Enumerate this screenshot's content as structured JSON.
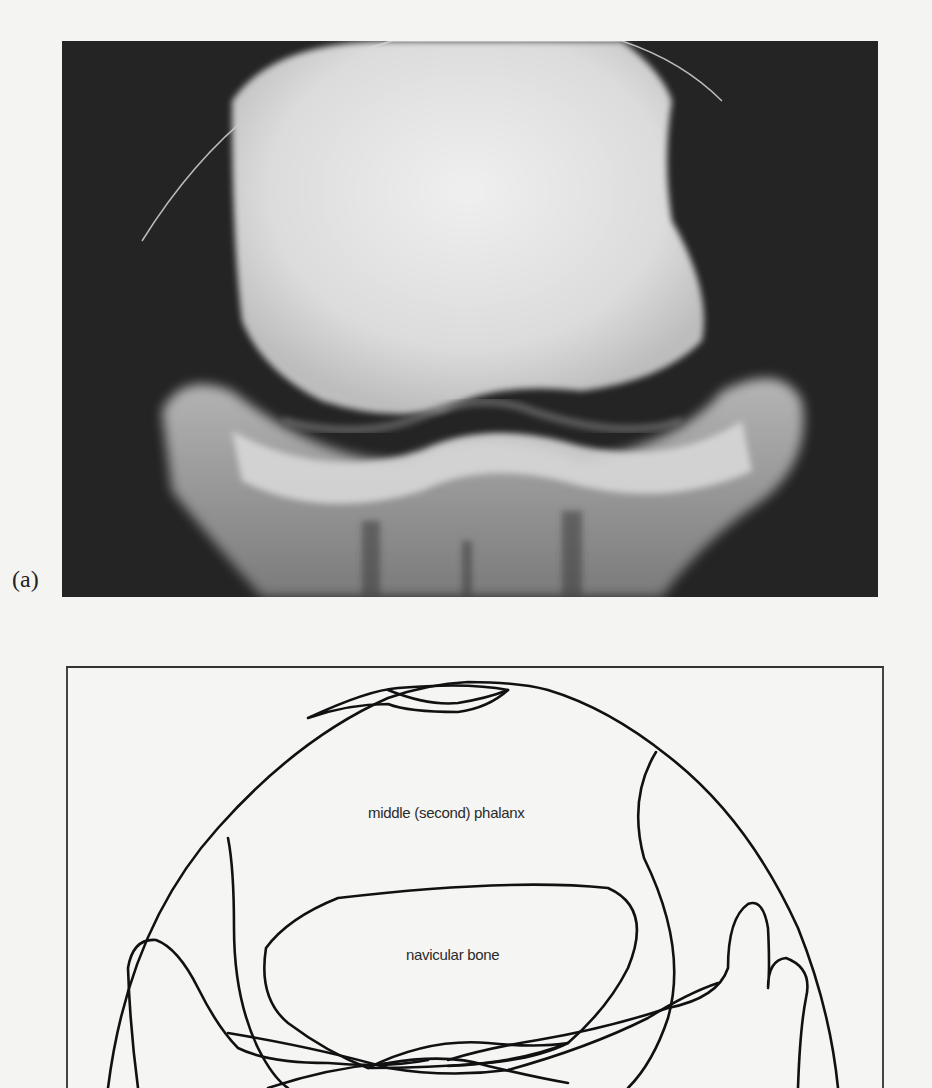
{
  "figure": {
    "panel_label": "(a)",
    "photo_description": "radiograph of navicular region",
    "labels": {
      "middle_phalanx": "middle (second) phalanx",
      "navicular_bone": "navicular bone"
    }
  }
}
